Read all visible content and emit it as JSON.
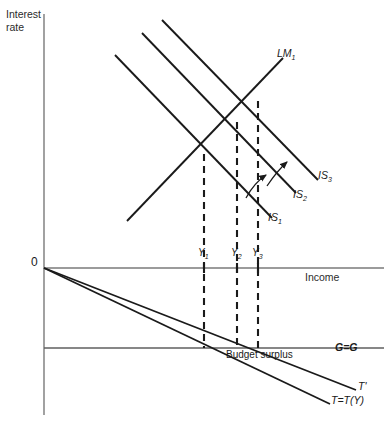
{
  "figure": {
    "domain": "economics-is-lm-budget-diagram",
    "width": 384,
    "height": 435,
    "background_color": "#ffffff",
    "line_color": "#1a1a1a",
    "axis_color": "#6b6b6b"
  },
  "axes": {
    "y_axis_title_line1": "Interest",
    "y_axis_title_line2": "rate",
    "x_axis_title": "Income",
    "origin_label": "0"
  },
  "curves": {
    "lm": {
      "label_text": "LM",
      "label_sub": "1",
      "name": "lm-1-curve"
    },
    "is1": {
      "label_text": "IS",
      "label_sub": "1",
      "name": "is-1-curve"
    },
    "is2": {
      "label_text": "IS",
      "label_sub": "2",
      "name": "is-2-curve"
    },
    "is3": {
      "label_text": "IS",
      "label_sub": "3",
      "name": "is-3-curve"
    }
  },
  "equilibria": [
    {
      "label_text": "Y",
      "label_sub": "1",
      "x": 204
    },
    {
      "label_text": "Y",
      "label_sub": "2",
      "x": 237
    },
    {
      "label_text": "Y",
      "label_sub": "3",
      "x": 258
    }
  ],
  "lower_panel": {
    "budget_surplus_label": "Budget surplus",
    "government_spending_label": "G=G",
    "tax_line_shifted_label": "T'",
    "tax_line_label": "T=T(Y)"
  },
  "geometry": {
    "y_axis_x": 44,
    "y_axis_top": 14,
    "y_axis_bottom": 415,
    "income_axis_y": 268,
    "income_axis_right": 384,
    "gg_axis_y": 348,
    "gg_axis_right": 384,
    "lm_line": {
      "x1": 127,
      "y1": 221,
      "x2": 283,
      "y2": 58
    },
    "is_lines": [
      {
        "name": "is1",
        "x1": 115,
        "y1": 55,
        "x2": 272,
        "y2": 218
      },
      {
        "name": "is2",
        "x1": 142,
        "y1": 33,
        "x2": 296,
        "y2": 193
      },
      {
        "name": "is3",
        "x1": 162,
        "y1": 20,
        "x2": 318,
        "y2": 180
      }
    ],
    "drop_lines": [
      {
        "x": 204,
        "y_top": 154,
        "y_bottom": 348
      },
      {
        "x": 237,
        "y_top": 122,
        "y_bottom": 348
      },
      {
        "x": 258,
        "y_top": 101,
        "y_bottom": 348
      }
    ],
    "tax_lines": [
      {
        "name": "t-prime",
        "x1": 44,
        "y1": 268,
        "x2": 356,
        "y2": 390
      },
      {
        "name": "t-of-y",
        "x1": 44,
        "y1": 268,
        "x2": 330,
        "y2": 404
      }
    ],
    "shift_arrows": [
      {
        "name": "is1-to-is2-arrow",
        "path": "M 246 196 Q 256 182 268 174"
      },
      {
        "name": "is2-to-is3-arrow",
        "path": "M 266 184 Q 278 170 288 161"
      }
    ]
  },
  "label_positions": {
    "y_axis_title": {
      "x": 6,
      "y": 8
    },
    "x_axis_title": {
      "x": 305,
      "y": 272
    },
    "origin": {
      "x": 31,
      "y": 258
    },
    "lm_label": {
      "x": 277,
      "y": 49
    },
    "is3_label": {
      "x": 318,
      "y": 170
    },
    "is2_label": {
      "x": 293,
      "y": 189
    },
    "is1_label": {
      "x": 268,
      "y": 213
    },
    "y1_label": {
      "x": 198,
      "y": 248
    },
    "y2_label": {
      "x": 231,
      "y": 248
    },
    "y3_label": {
      "x": 252,
      "y": 248
    },
    "budget_surplus": {
      "x": 226,
      "y": 350
    },
    "gg_label": {
      "x": 335,
      "y": 348
    },
    "t_prime_label": {
      "x": 357,
      "y": 383
    },
    "t_of_y_label": {
      "x": 331,
      "y": 396
    }
  }
}
